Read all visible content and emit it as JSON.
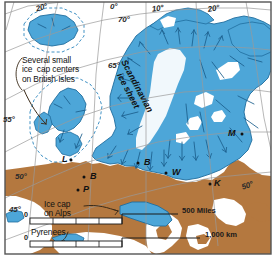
{
  "map": {
    "title": "Pleistocene ice sheets of northern Europe",
    "colors": {
      "ice": "#4da6d8",
      "ice_light": "#8fd0ee",
      "ice_dark": "#2d86bd",
      "land": "#b4783f",
      "sea": "#ffffff",
      "outline": "#1f6d9e",
      "flowline": "#1b5f8c",
      "graticule": "#9a9a9a",
      "border": "#555555",
      "text": "#111111"
    },
    "border_label": "map-frame",
    "annotations": [
      {
        "id": "british-isles-note",
        "text": "Several small\nice  cap centers\non British Isles",
        "x": 22,
        "y": 56
      },
      {
        "id": "alps-note",
        "text": "Ice cap\non Alps",
        "x": 44,
        "y": 200
      },
      {
        "id": "pyrenees-note",
        "text": "Pyrenees",
        "x": 31,
        "y": 228
      }
    ],
    "ice_sheet_label": {
      "id": "scandinavian-ice-sheet",
      "text": "Scandinavian\nice sheet",
      "x": 152,
      "y": 60,
      "rotation": 62
    },
    "graticule_labels": [
      {
        "id": "lon-20-w",
        "text": "20°",
        "x": 36,
        "y": 4
      },
      {
        "id": "lon-0",
        "text": "0°",
        "x": 110,
        "y": 3
      },
      {
        "id": "lon-10-e",
        "text": "10°",
        "x": 152,
        "y": 5
      },
      {
        "id": "lon-20-e",
        "text": "20°",
        "x": 208,
        "y": 5
      },
      {
        "id": "lat-70",
        "text": "70°",
        "x": 118,
        "y": 16
      },
      {
        "id": "lat-65",
        "text": "65°",
        "x": 108,
        "y": 62
      },
      {
        "id": "lat-55",
        "text": "55°",
        "x": 3,
        "y": 116
      },
      {
        "id": "lat-50-left",
        "text": "50°",
        "x": 15,
        "y": 173
      },
      {
        "id": "lat-45-left",
        "text": "45°",
        "x": 9,
        "y": 206
      },
      {
        "id": "lat-50-right",
        "text": "50°",
        "x": 242,
        "y": 182
      }
    ],
    "point_labels": [
      {
        "id": "point-l",
        "text": "L",
        "x": 62,
        "y": 160
      },
      {
        "id": "point-b-west",
        "text": "B",
        "x": 90,
        "y": 177
      },
      {
        "id": "point-p",
        "text": "P",
        "x": 83,
        "y": 191
      },
      {
        "id": "point-b-east",
        "text": "B",
        "x": 144,
        "y": 164
      },
      {
        "id": "point-w",
        "text": "W",
        "x": 172,
        "y": 173
      },
      {
        "id": "point-k",
        "text": "K",
        "x": 214,
        "y": 184
      },
      {
        "id": "point-m",
        "text": "M",
        "x": 232,
        "y": 134
      }
    ],
    "scale_bars": [
      {
        "id": "scale-miles",
        "label": "500 Miles",
        "unit": "Miles",
        "value": "500",
        "zero": "0",
        "segments": 4,
        "x": 30,
        "y": 222,
        "width": 92,
        "label_x": 182,
        "label_y": 211
      },
      {
        "id": "scale-km",
        "label": "1,000 km",
        "unit": "km",
        "value": "1,000",
        "zero": "0",
        "segments": 4,
        "x": 30,
        "y": 245,
        "width": 92,
        "label_x": 205,
        "label_y": 236
      }
    ]
  }
}
